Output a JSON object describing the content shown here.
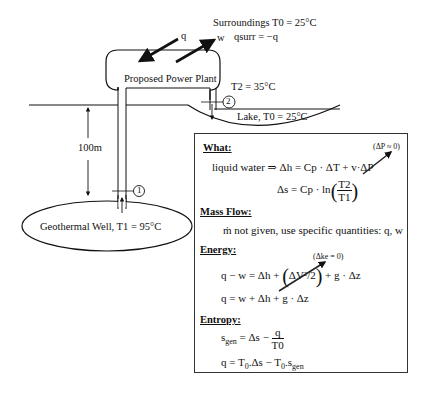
{
  "diagram": {
    "surroundings": {
      "label": "Surroundings T0 = 25°C",
      "q_surr": "qsurr = −q"
    },
    "arrows": {
      "heat": "q",
      "work": "w"
    },
    "plant": {
      "label": "Proposed Power Plant"
    },
    "state2": {
      "temperature": "T2 = 35°C",
      "marker": "2"
    },
    "lake": {
      "label": "Lake, T0 = 25°C"
    },
    "depth": {
      "label": "100m"
    },
    "state1": {
      "marker": "1"
    },
    "well": {
      "label": "Geothermal Well,  T1 = 95°C"
    }
  },
  "analysis": {
    "what": {
      "heading": "What:",
      "note_dp": "(ΔP ≈ 0)",
      "line1_lhs": "liquid water  ⇒  Δh = Cp · ΔT + v·ΔP",
      "line2_lhs": "Δs = Cp · ln",
      "line2_num": "T2",
      "line2_den": "T1"
    },
    "mass_flow": {
      "heading": "Mass Flow:",
      "text": "ṁ not given,  use specific quantities:  q,  w"
    },
    "energy": {
      "heading": "Energy:",
      "note_dke": "(Δke = 0)",
      "eq1_lhs": "q − w = Δh + ",
      "eq1_term": "ΔV²/2",
      "eq1_rhs": " + g · Δz",
      "eq2": "q = w + Δh + g · Δz"
    },
    "entropy": {
      "heading": "Entropy:",
      "eq1_lhs": "s",
      "eq1_sub": "gen",
      "eq1_mid": " = Δs − ",
      "eq1_num": "q",
      "eq1_den": "T0",
      "eq2_a": "q = T",
      "eq2_sub0": "0",
      "eq2_b": ".Δs − T",
      "eq2_sub1": "0",
      "eq2_c": ".s",
      "eq2_sub2": "gen"
    }
  }
}
